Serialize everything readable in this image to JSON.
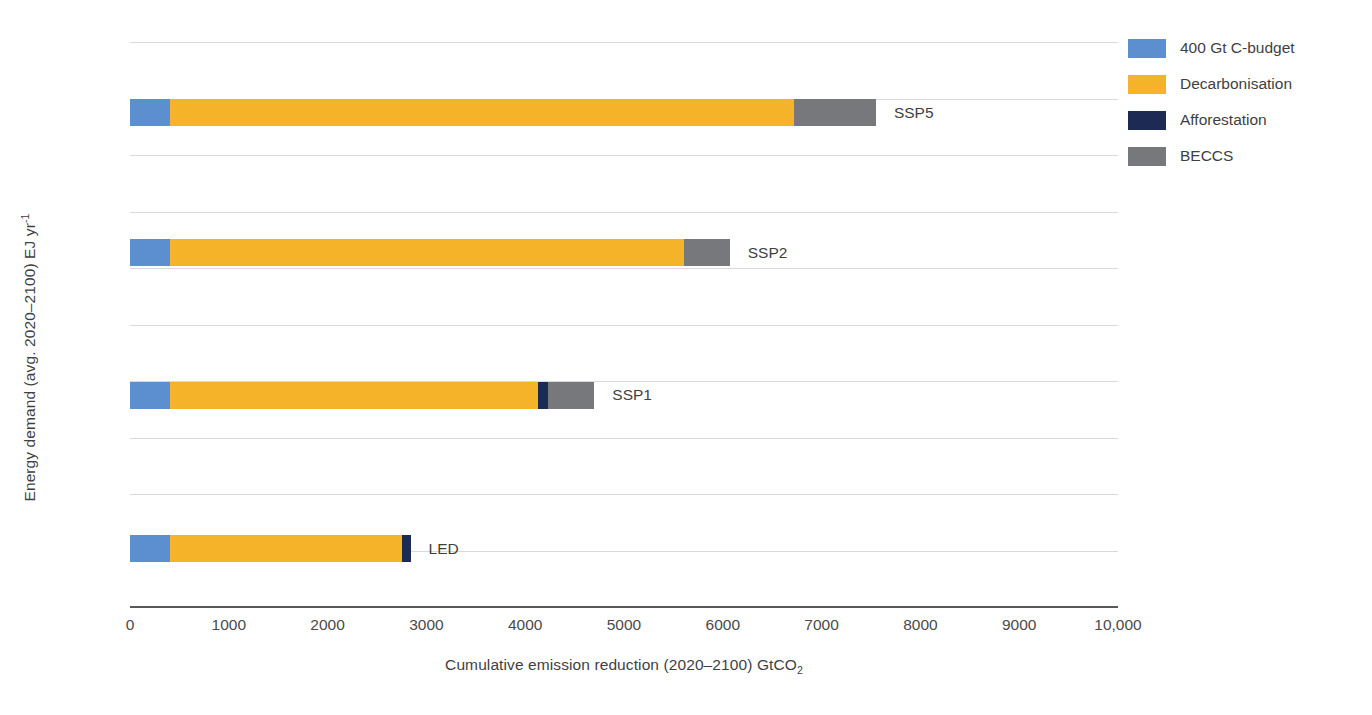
{
  "chart_data": {
    "type": "bar",
    "orientation": "horizontal",
    "title": "",
    "xlabel": "Cumulative emission reduction (2020–2100) GtCO",
    "xlabel_sub": "2",
    "ylabel": "Energy demand (avg. 2020–2100) EJ yr",
    "ylabel_sup": "-1",
    "xlim": [
      0,
      10000
    ],
    "ylim": [
      0,
      1000
    ],
    "grid": true,
    "xticks": [
      "0",
      "1000",
      "2000",
      "3000",
      "4000",
      "5000",
      "6000",
      "7000",
      "8000",
      "9000",
      "10,000"
    ],
    "xtick_values": [
      0,
      1000,
      2000,
      3000,
      4000,
      5000,
      6000,
      7000,
      8000,
      9000,
      10000
    ],
    "yticks": [
      "0",
      "100",
      "200",
      "300",
      "400",
      "500",
      "600",
      "700",
      "800",
      "900",
      "1000"
    ],
    "ytick_values": [
      0,
      100,
      200,
      300,
      400,
      500,
      600,
      700,
      800,
      900,
      1000
    ],
    "legend_position": "right",
    "stacked": true,
    "series": [
      {
        "name": "400 Gt C-budget",
        "color": "#5b8fd0",
        "values": [
          400,
          400,
          400,
          400
        ]
      },
      {
        "name": "Decarbonisation",
        "color": "#f5b329",
        "values": [
          2350,
          3730,
          5210,
          6320
        ]
      },
      {
        "name": "Afforestation",
        "color": "#1d2a54",
        "values": [
          90,
          100,
          0,
          0
        ]
      },
      {
        "name": "BECCS",
        "color": "#77787b",
        "values": [
          0,
          470,
          460,
          830
        ]
      }
    ],
    "bars": [
      {
        "label": "LED",
        "y_center": 103,
        "y_low": 79,
        "y_high": 127,
        "total": 2840,
        "segments": [
          {
            "name": "400 Gt C-budget",
            "start": 0,
            "end": 400,
            "value": 400,
            "color": "#5b8fd0"
          },
          {
            "name": "Decarbonisation",
            "start": 400,
            "end": 2750,
            "value": 2350,
            "color": "#f5b329"
          },
          {
            "name": "Afforestation",
            "start": 2750,
            "end": 2840,
            "value": 90,
            "color": "#1d2a54"
          }
        ]
      },
      {
        "label": "SSP1",
        "y_center": 375,
        "y_low": 351,
        "y_high": 399,
        "total": 4700,
        "segments": [
          {
            "name": "400 Gt C-budget",
            "start": 0,
            "end": 400,
            "value": 400,
            "color": "#5b8fd0"
          },
          {
            "name": "Decarbonisation",
            "start": 400,
            "end": 4130,
            "value": 3730,
            "color": "#f5b329"
          },
          {
            "name": "Afforestation",
            "start": 4130,
            "end": 4230,
            "value": 100,
            "color": "#1d2a54"
          },
          {
            "name": "BECCS",
            "start": 4230,
            "end": 4700,
            "value": 470,
            "color": "#77787b"
          }
        ]
      },
      {
        "label": "SSP2",
        "y_center": 627,
        "y_low": 603,
        "y_high": 651,
        "total": 6070,
        "segments": [
          {
            "name": "400 Gt C-budget",
            "start": 0,
            "end": 400,
            "value": 400,
            "color": "#5b8fd0"
          },
          {
            "name": "Decarbonisation",
            "start": 400,
            "end": 5610,
            "value": 5210,
            "color": "#f5b329"
          },
          {
            "name": "BECCS",
            "start": 5610,
            "end": 6070,
            "value": 460,
            "color": "#77787b"
          }
        ]
      },
      {
        "label": "SSP5",
        "y_center": 875,
        "y_low": 851,
        "y_high": 899,
        "total": 7550,
        "segments": [
          {
            "name": "400 Gt C-budget",
            "start": 0,
            "end": 400,
            "value": 400,
            "color": "#5b8fd0"
          },
          {
            "name": "Decarbonisation",
            "start": 400,
            "end": 6720,
            "value": 6320,
            "color": "#f5b329"
          },
          {
            "name": "BECCS",
            "start": 6720,
            "end": 7550,
            "value": 830,
            "color": "#77787b"
          }
        ]
      }
    ]
  },
  "legend": {
    "items": [
      {
        "label": "400 Gt C-budget",
        "color": "#5b8fd0"
      },
      {
        "label": "Decarbonisation",
        "color": "#f5b329"
      },
      {
        "label": "Afforestation",
        "color": "#1d2a54"
      },
      {
        "label": "BECCS",
        "color": "#77787b"
      }
    ]
  }
}
